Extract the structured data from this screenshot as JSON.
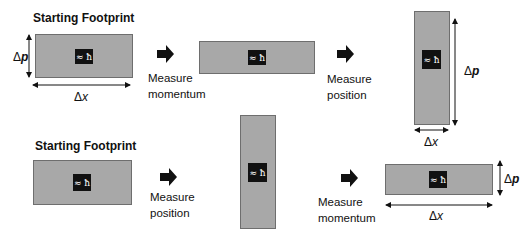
{
  "rows": [
    {
      "title": "Starting Footprint",
      "steps": [
        {
          "footprint": {
            "label": "≈ ħ",
            "dx": "Δx",
            "dp_symbol": "Δ",
            "dp_var": "p"
          }
        },
        {
          "action": {
            "line1": "Measure",
            "line2": "momentum"
          }
        },
        {
          "footprint": {
            "label": "≈ ħ"
          }
        },
        {
          "action": {
            "line1": "Measure",
            "line2": "position"
          }
        },
        {
          "footprint": {
            "label": "≈ ħ",
            "dx": "Δx",
            "dp_symbol": "Δ",
            "dp_var": "p"
          }
        }
      ]
    },
    {
      "title": "Starting Footprint",
      "steps": [
        {
          "footprint": {
            "label": "≈ ħ"
          }
        },
        {
          "action": {
            "line1": "Measure",
            "line2": "position"
          }
        },
        {
          "footprint": {
            "label": "≈ ħ"
          }
        },
        {
          "action": {
            "line1": "Measure",
            "line2": "momentum"
          }
        },
        {
          "footprint": {
            "label": "≈ ħ",
            "dx": "Δx",
            "dp_symbol": "Δ",
            "dp_var": "p"
          }
        }
      ]
    }
  ],
  "colors": {
    "footprint_fill": "#a8a8a8",
    "footprint_border": "#6e6e6e",
    "hbar_box": "#111111",
    "arrow": "#111111"
  }
}
